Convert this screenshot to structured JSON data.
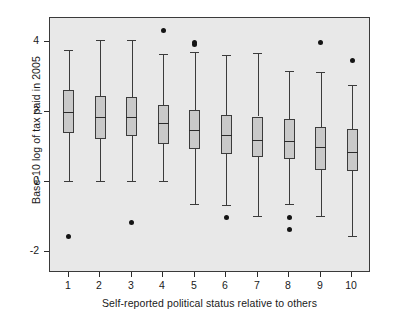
{
  "chart_data": {
    "type": "box",
    "title": "",
    "xlabel": "Self-reported political status relative to others",
    "ylabel": "Base-10 log of tax paid in 2005",
    "categories": [
      "1",
      "2",
      "3",
      "4",
      "5",
      "6",
      "7",
      "8",
      "9",
      "10"
    ],
    "ytick_labels": [
      "-2",
      "0",
      "2",
      "4"
    ],
    "ytick_values": [
      -2,
      0,
      2,
      4
    ],
    "ylim": [
      -2.6,
      4.7
    ],
    "xlim": [
      0.4,
      10.6
    ],
    "grid": false,
    "legend": null,
    "boxes": [
      {
        "category": "1",
        "whisker_low": 0.02,
        "q1": 1.4,
        "median": 2.0,
        "q3": 2.63,
        "whisker_high": 3.77,
        "outliers": [
          -1.55
        ]
      },
      {
        "category": "2",
        "whisker_low": 0.02,
        "q1": 1.24,
        "median": 1.87,
        "q3": 2.46,
        "whisker_high": 4.07,
        "outliers": []
      },
      {
        "category": "3",
        "whisker_low": 0.02,
        "q1": 1.31,
        "median": 1.87,
        "q3": 2.44,
        "whisker_high": 4.07,
        "outliers": [
          -1.16
        ]
      },
      {
        "category": "4",
        "whisker_low": 0.02,
        "q1": 1.1,
        "median": 1.68,
        "q3": 2.21,
        "whisker_high": 3.67,
        "outliers": [
          4.33
        ]
      },
      {
        "category": "5",
        "whisker_low": -0.63,
        "q1": 0.95,
        "median": 1.5,
        "q3": 2.06,
        "whisker_high": 3.72,
        "outliers": [
          3.93,
          3.99
        ]
      },
      {
        "category": "6",
        "whisker_low": -0.64,
        "q1": 0.81,
        "median": 1.36,
        "q3": 1.91,
        "whisker_high": 3.65,
        "outliers": [
          -1.0
        ]
      },
      {
        "category": "7",
        "whisker_low": -0.97,
        "q1": 0.72,
        "median": 1.2,
        "q3": 1.88,
        "whisker_high": 3.7,
        "outliers": []
      },
      {
        "category": "8",
        "whisker_low": -0.62,
        "q1": 0.67,
        "median": 1.19,
        "q3": 1.8,
        "whisker_high": 3.18,
        "outliers": [
          -1.0,
          -1.35
        ]
      },
      {
        "category": "9",
        "whisker_low": -0.97,
        "q1": 0.34,
        "median": 1.0,
        "q3": 1.58,
        "whisker_high": 3.15,
        "outliers": [
          3.99
        ]
      },
      {
        "category": "10",
        "whisker_low": -1.55,
        "q1": 0.31,
        "median": 0.85,
        "q3": 1.52,
        "whisker_high": 2.78,
        "outliers": [
          3.48
        ]
      }
    ],
    "colors": {
      "panel_background": "#e8e8e8",
      "figure_background": "#ffffff",
      "box_fill": "#c9c9c9",
      "line": "#3b3b3b",
      "text": "#1a1a1a",
      "outlier": "#141414"
    }
  }
}
